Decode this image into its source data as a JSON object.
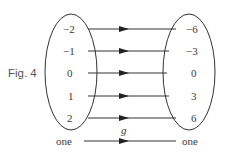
{
  "figure": {
    "caption": "Fig. 4",
    "mapping_label": "g",
    "domain_set": [
      "−2",
      "−1",
      "0",
      "1",
      "2"
    ],
    "codomain_set": [
      "−6",
      "−3",
      "0",
      "3",
      "6"
    ],
    "bottom_left": "one",
    "bottom_right": "one"
  },
  "style": {
    "stroke": "#333333",
    "text": "#3a3a3a"
  }
}
